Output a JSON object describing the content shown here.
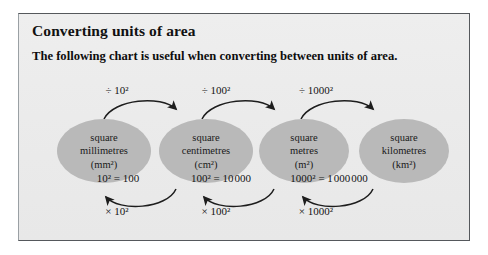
{
  "panel": {
    "title": "Converting units of area",
    "subtitle": "The following chart is useful when converting between units of area.",
    "background_color": "#ececec",
    "border_color": "#55585c",
    "node_fill": "#b9b9b9",
    "text_color": "#141414"
  },
  "diagram": {
    "nodes": [
      {
        "line1": "square",
        "line2": "millimetres",
        "line3": "(mm²)"
      },
      {
        "line1": "square",
        "line2": "centimetres",
        "line3": "(cm²)"
      },
      {
        "line1": "square",
        "line2": "metres",
        "line3": "(m²)"
      },
      {
        "line1": "square",
        "line2": "kilometres",
        "line3": "(km²)"
      }
    ],
    "divide_labels": [
      "÷ 10²",
      "÷ 100²",
      "÷ 1000²"
    ],
    "equations": [
      "10² = 100",
      "100² = 10 000",
      "1000² = 1 000 000"
    ],
    "multiply_labels": [
      "× 10²",
      "× 100²",
      "× 1000²"
    ]
  }
}
